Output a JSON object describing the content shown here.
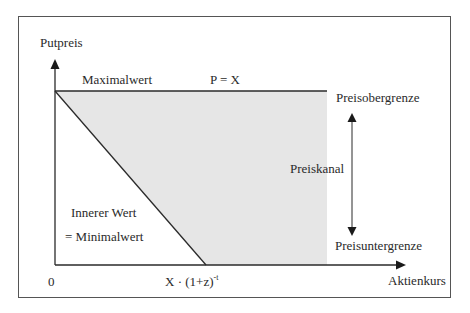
{
  "diagram": {
    "y_axis_label": "Putpreis",
    "x_axis_label": "Aktienkurs",
    "origin_label": "0",
    "max_value_label": "Maximalwert",
    "max_value_formula": "P = X",
    "upper_bound_label": "Preisobergrenze",
    "lower_bound_label": "Preisuntergrenze",
    "channel_label": "Preiskanal",
    "intrinsic_value_label": "Innerer Wert",
    "min_value_label": "= Minimalwert",
    "x_intercept_base": "X · (1+z)",
    "x_intercept_exponent": "-t"
  },
  "colors": {
    "line": "#2a2a2a",
    "fill": "#e6e6e6",
    "frame": "#555555",
    "background": "#ffffff"
  }
}
